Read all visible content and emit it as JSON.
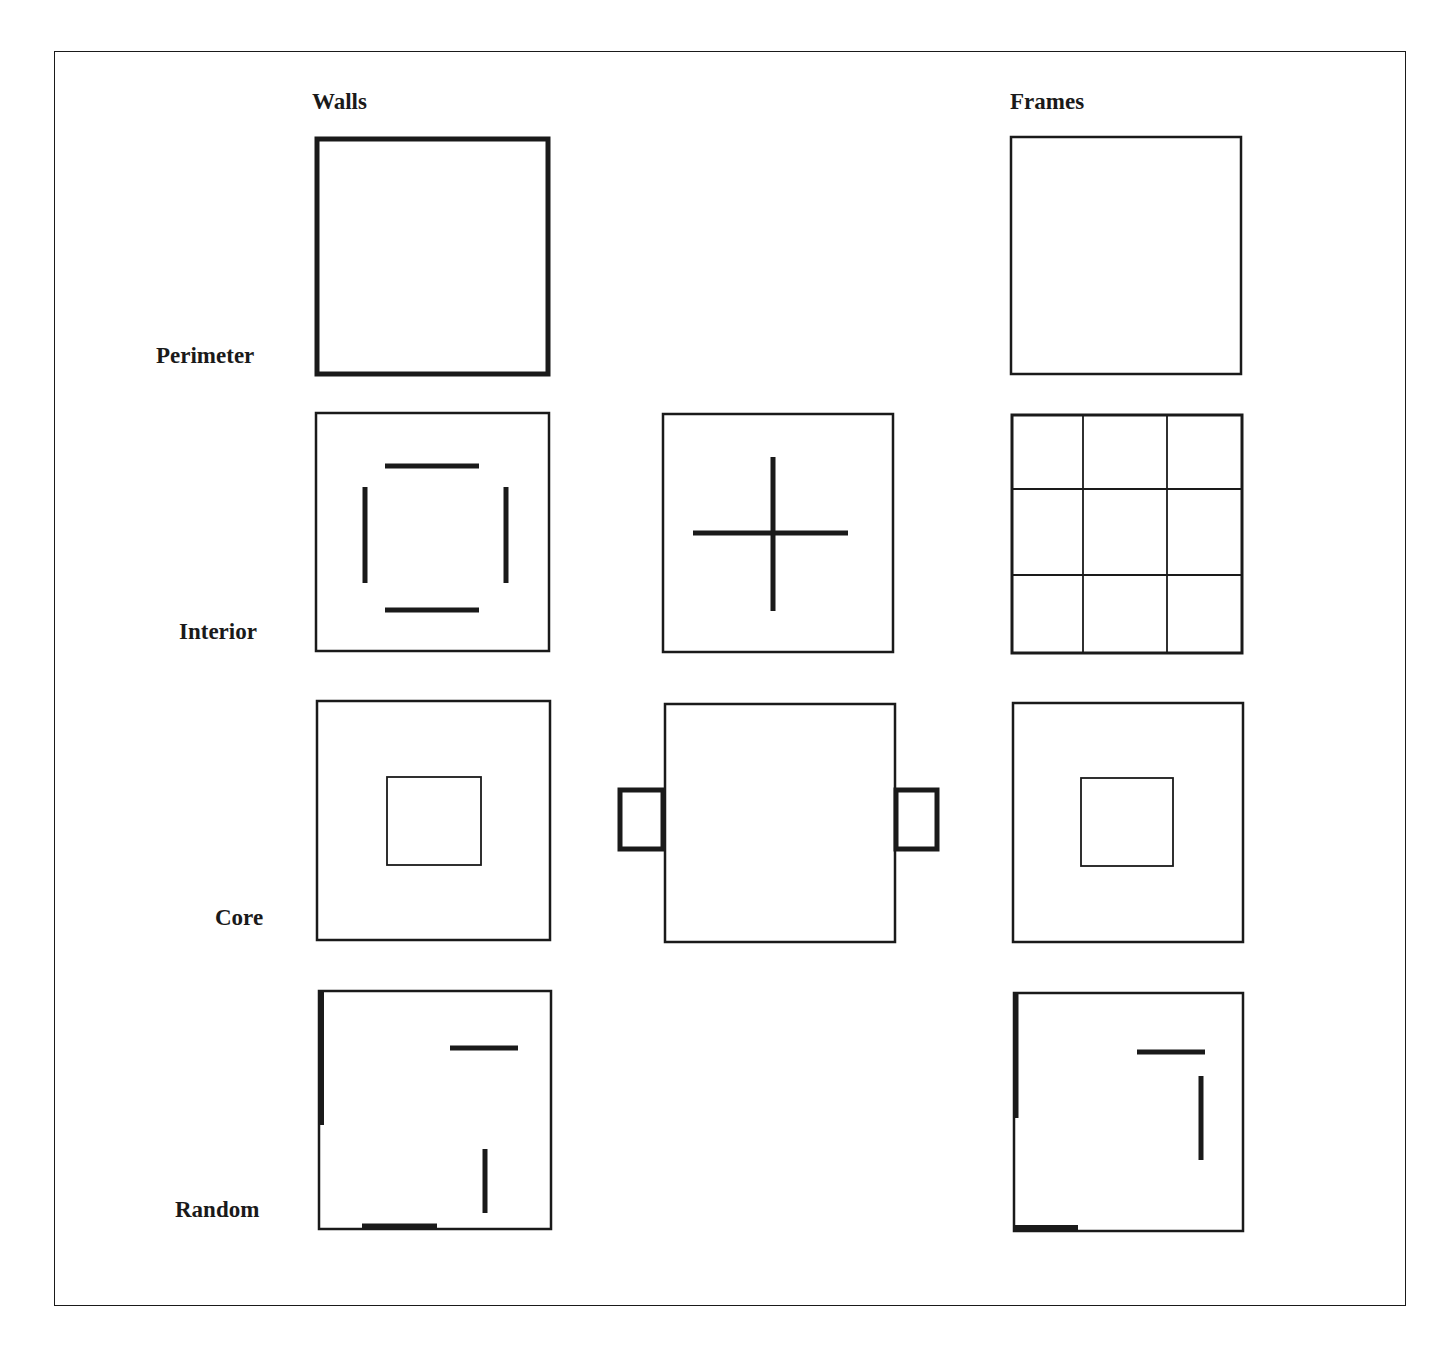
{
  "columns": {
    "walls": "Walls",
    "frames": "Frames"
  },
  "rows": {
    "perimeter": "Perimeter",
    "interior": "Interior",
    "core": "Core",
    "random": "Random"
  },
  "colors": {
    "stroke": "#1a1a1a",
    "background": "#ffffff"
  },
  "panels": [
    {
      "row": "Perimeter",
      "column": "Walls",
      "description": "Square plan with thick perimeter walls"
    },
    {
      "row": "Perimeter",
      "column": "Frames",
      "description": "Square plan with thin perimeter frame"
    },
    {
      "row": "Interior",
      "column": "Walls",
      "description": "Four interior wall segments forming an open square"
    },
    {
      "row": "Interior",
      "column": "Middle",
      "description": "Cross-shaped interior walls"
    },
    {
      "row": "Interior",
      "column": "Frames",
      "description": "3x3 grid of interior frames"
    },
    {
      "row": "Core",
      "column": "Walls",
      "description": "Central core square"
    },
    {
      "row": "Core",
      "column": "Middle",
      "description": "Two thick-walled cores attached outside left and right edges"
    },
    {
      "row": "Core",
      "column": "Frames",
      "description": "Central core square within frame"
    },
    {
      "row": "Random",
      "column": "Walls",
      "description": "Randomly placed wall segments"
    },
    {
      "row": "Random",
      "column": "Frames",
      "description": "Randomly placed wall segments within frame"
    }
  ]
}
